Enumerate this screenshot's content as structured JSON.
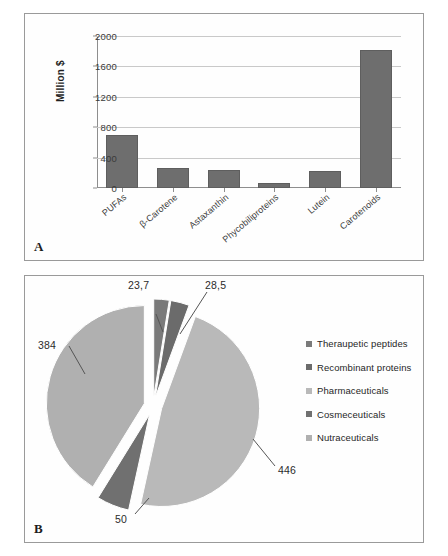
{
  "figure": {
    "panel_a_tag": "A",
    "panel_b_tag": "B"
  },
  "chart_data": [
    {
      "type": "bar",
      "panel": "A",
      "title": "",
      "xlabel": "",
      "ylabel": "Million $",
      "ylim": [
        0,
        2000
      ],
      "yticks": [
        0,
        400,
        800,
        1200,
        1600,
        2000
      ],
      "ytick_labels": [
        "0",
        "400",
        "800",
        "1200",
        "1600",
        "2000"
      ],
      "grid": true,
      "bar_color": "#6e6e6e",
      "categories": [
        "PUFAs",
        "β-Carotene",
        "Astaxanthin",
        "Phycobiliproteins",
        "Lutein",
        "Carotenoids"
      ],
      "values": [
        700,
        260,
        240,
        60,
        230,
        1820
      ]
    },
    {
      "type": "pie",
      "panel": "B",
      "title": "",
      "exploded": true,
      "legend_position": "right",
      "labels": [
        "Theraupetic peptides",
        "Recombinant proteins",
        "Pharmaceuticals",
        "Cosmeceuticals",
        "Nutraceuticals"
      ],
      "values": [
        23.7,
        28.5,
        446,
        50,
        384
      ],
      "value_labels": [
        "23,7",
        "28,5",
        "446",
        "50",
        "384"
      ],
      "colors": [
        "#7a7a7a",
        "#6b6b6b",
        "#b9b9b9",
        "#707070",
        "#b0b0b0"
      ]
    }
  ]
}
